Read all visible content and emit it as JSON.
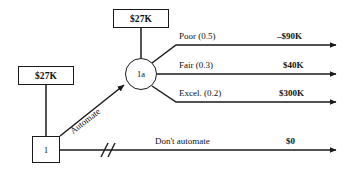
{
  "diagram": {
    "type": "decision-tree",
    "stroke_color": "#1a1a1a",
    "text_color": "#111111",
    "background": "#ffffff"
  },
  "nodes": {
    "decision": {
      "id": "decision-node",
      "label": "1",
      "shape": "square"
    },
    "chance": {
      "id": "chance-node",
      "label": "1a",
      "shape": "circle"
    }
  },
  "rollback_values": {
    "decision_node_value": "$27K",
    "chance_node_value": "$27K"
  },
  "branches": {
    "automate": {
      "label": "Automate",
      "pruned": false
    },
    "dont_automate": {
      "label": "Don't automate",
      "payoff": "$0",
      "pruned": true,
      "prune_mark": "//"
    }
  },
  "outcomes": [
    {
      "label": "Poor (0.5)",
      "state": "Poor",
      "probability": "0.5",
      "payoff": "–$90K"
    },
    {
      "label": "Fair (0.3)",
      "state": "Fair",
      "probability": "0.3",
      "payoff": "$40K"
    },
    {
      "label": "Excel. (0.2)",
      "state": "Excel.",
      "probability": "0.2",
      "payoff": "$300K"
    }
  ]
}
